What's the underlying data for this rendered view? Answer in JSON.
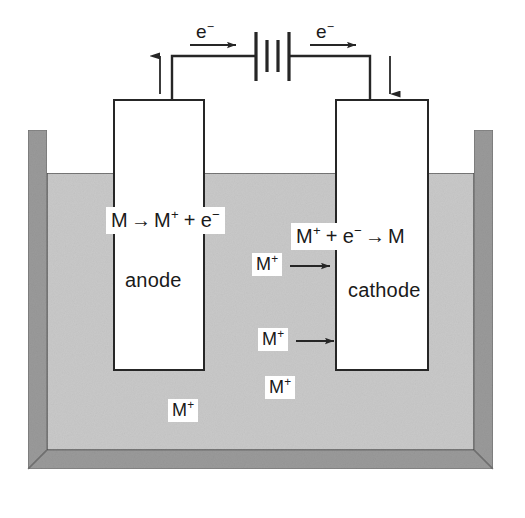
{
  "diagram": {
    "colors": {
      "beaker_wall": "#9a9a9a",
      "beaker_wall_shade": "#8a8a8a",
      "solution": "#c9c9c9",
      "electrode_fill": "#ffffff",
      "stroke": "#262626",
      "background": "#ffffff",
      "text": "#1a1a1a"
    },
    "circuit": {
      "battery_label": "battery-symbol",
      "left_electron_label": "e",
      "left_electron_charge": "−",
      "right_electron_label": "e",
      "right_electron_charge": "−",
      "left_wire_arrow_direction": "up",
      "right_wire_arrow_direction": "down",
      "left_flow_arrow_direction": "right",
      "right_flow_arrow_direction": "right"
    },
    "electrodes": [
      {
        "id": "anode",
        "name": "anode",
        "equation_plain": "M → M+ + e−",
        "equation_parts": {
          "a": "M",
          "arrow": "→",
          "b": "M",
          "b_sup": "+",
          "plus": "+",
          "c": "e",
          "c_sup": "−"
        }
      },
      {
        "id": "cathode",
        "name": "cathode",
        "equation_plain": "M+ + e− → M",
        "equation_parts": {
          "a": "M",
          "a_sup": "+",
          "plus": "+",
          "b": "e",
          "b_sup": "−",
          "arrow": "→",
          "c": "M"
        }
      }
    ],
    "solution": {
      "ion_symbol": "M",
      "ion_charge": "+",
      "ions": [
        {
          "id": "ion-1",
          "label": "M",
          "charge": "+",
          "arrow": true,
          "arrow_direction": "right"
        },
        {
          "id": "ion-2",
          "label": "M",
          "charge": "+",
          "arrow": true,
          "arrow_direction": "right"
        },
        {
          "id": "ion-3",
          "label": "M",
          "charge": "+",
          "arrow": false
        },
        {
          "id": "ion-4",
          "label": "M",
          "charge": "+",
          "arrow": false
        }
      ]
    }
  }
}
